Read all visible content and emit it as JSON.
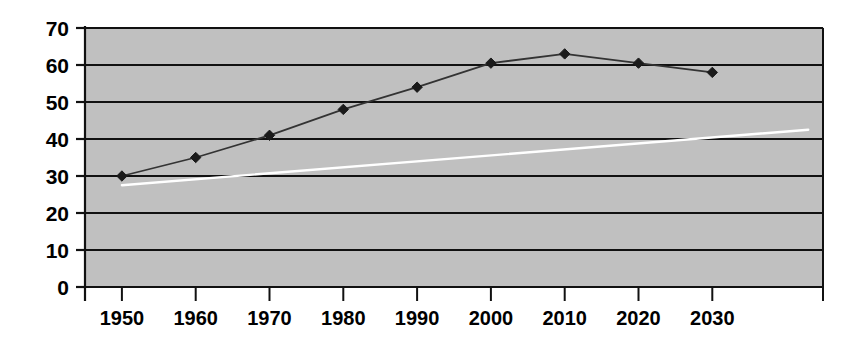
{
  "chart_data": {
    "type": "line",
    "title": "",
    "subtitle": "",
    "xlabel": "",
    "ylabel": "",
    "xlim": [
      1945,
      2045
    ],
    "ylim": [
      0,
      70
    ],
    "grid": true,
    "grid_axis": "y",
    "legend": "none",
    "plot_background": "#c0c0c0",
    "page_background": "#ffffff",
    "x_tick_labels": [
      "1950",
      "1960",
      "1970",
      "1980",
      "1990",
      "2000",
      "2010",
      "2020",
      "2030"
    ],
    "x_tick_values": [
      1950,
      1960,
      1970,
      1980,
      1990,
      2000,
      2010,
      2020,
      2030
    ],
    "y_tick_labels": [
      "0",
      "10",
      "20",
      "30",
      "40",
      "50",
      "60",
      "70"
    ],
    "y_tick_values": [
      0,
      10,
      20,
      30,
      40,
      50,
      60,
      70
    ],
    "series": [
      {
        "name": "observed-and-projected",
        "color": "#333333",
        "marker": "diamond",
        "marker_color": "#1a1a1a",
        "line_width": 1.8,
        "x": [
          1950,
          1960,
          1970,
          1980,
          1990,
          2000,
          2010,
          2020,
          2030
        ],
        "values": [
          30,
          35,
          41,
          48,
          54,
          60.5,
          63,
          60.5,
          58
        ]
      },
      {
        "name": "trend-line",
        "color": "#ffffff",
        "marker": "none",
        "marker_color": "#ffffff",
        "line_width": 2.4,
        "x": [
          1950,
          2043
        ],
        "values": [
          27.5,
          42.5
        ]
      }
    ]
  }
}
